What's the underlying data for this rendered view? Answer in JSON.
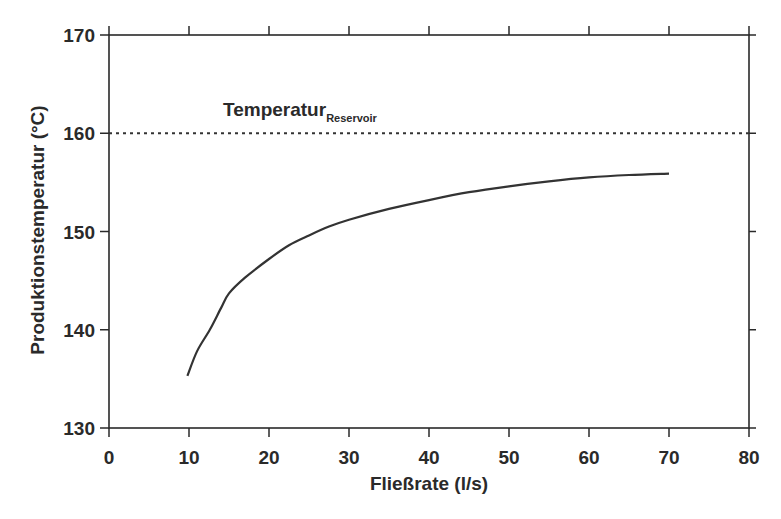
{
  "chart_data": {
    "type": "line",
    "title": "",
    "xlabel": "Fließrate (l/s)",
    "ylabel": "Produktionstemperatur (°C)",
    "xlim": [
      0,
      80
    ],
    "ylim": [
      130,
      170
    ],
    "x_ticks": [
      0,
      10,
      20,
      30,
      40,
      50,
      60,
      70,
      80
    ],
    "y_ticks": [
      130,
      140,
      150,
      160,
      170
    ],
    "grid": false,
    "legend": null,
    "series": [
      {
        "name": "Produktionstemperatur",
        "style": "solid",
        "x": [
          9.8,
          11,
          12.6,
          14,
          15,
          17,
          20,
          22.5,
          25,
          27.5,
          30,
          35,
          40,
          45,
          50,
          55,
          60,
          65,
          70
        ],
        "y": [
          135.3,
          137.8,
          140.0,
          142.2,
          143.7,
          145.3,
          147.2,
          148.6,
          149.6,
          150.5,
          151.2,
          152.3,
          153.2,
          154.0,
          154.6,
          155.1,
          155.5,
          155.75,
          155.9
        ]
      },
      {
        "name": "Temperatur Reservoir",
        "style": "dotted",
        "x": [
          0,
          80
        ],
        "y": [
          160,
          160
        ]
      }
    ],
    "annotations": [
      {
        "text": "Temperatur",
        "subscript": "Reservoir",
        "x": 12,
        "y": 161.3
      }
    ]
  },
  "labels": {
    "xlabel": "Fließrate (l/s)",
    "ylabel": "Produktionstemperatur (°C)",
    "annotation_main": "Temperatur",
    "annotation_sub": "Reservoir"
  },
  "colors": {
    "axis": "#2a2a2a",
    "curve": "#333333",
    "text": "#2a2a2a"
  }
}
